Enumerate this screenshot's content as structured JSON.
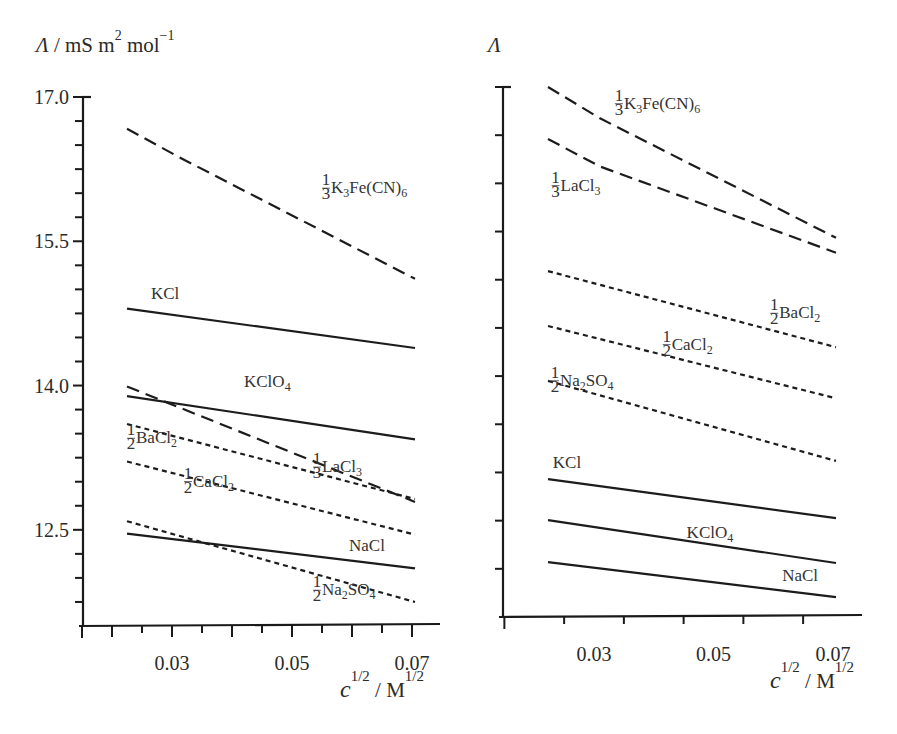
{
  "chart_data": [
    {
      "type": "line",
      "panel": "left",
      "title": "",
      "ylabel": "Λ / mS m² mol⁻¹",
      "ylabel_parts": {
        "symbol": "Λ",
        "unit": "/  mS m",
        "exp1": "2",
        "unit2": " mol",
        "exp2": "−1"
      },
      "xlabel": "c^{1/2} / M^{1/2}",
      "xlabel_parts": {
        "base": "c",
        "exp1": "1/2",
        "sep": " /  M",
        "exp2": "1/2"
      },
      "xlim": [
        0.015,
        0.075
      ],
      "ylim": [
        11.5,
        17.0
      ],
      "x_ticks_labeled": [
        0.03,
        0.05,
        0.07
      ],
      "x_tick_labels": [
        "0.03",
        "0.05",
        "0.07"
      ],
      "x_minor_step": 0.005,
      "y_ticks_labeled": [
        17.0,
        15.5,
        14.0,
        12.5
      ],
      "y_tick_labels": [
        "17.0",
        "15.5",
        "14.0",
        "12.5"
      ],
      "y_minor_step": 0.25,
      "grid": false,
      "series": [
        {
          "name": "⅓K₃Fe(CN)₆",
          "label_main": "K",
          "style": "long-dash",
          "x": [
            0.0225,
            0.031,
            0.0705
          ],
          "y": [
            16.67,
            16.38,
            15.11
          ],
          "label_pos": [
            0.055,
            16.0
          ],
          "frac": "1/3",
          "label_parts": [
            "K",
            "3",
            "Fe(CN)",
            "6"
          ]
        },
        {
          "name": "KCl",
          "style": "solid",
          "x": [
            0.0225,
            0.0705
          ],
          "y": [
            14.8,
            14.39
          ],
          "label_pos": [
            0.0265,
            14.9
          ],
          "label_parts": [
            "KCl"
          ]
        },
        {
          "name": "KClO₄",
          "style": "solid",
          "x": [
            0.0225,
            0.0705
          ],
          "y": [
            13.89,
            13.44
          ],
          "label_pos": [
            0.042,
            13.98
          ],
          "label_parts": [
            "KClO",
            "4"
          ]
        },
        {
          "name": "⅓LaCl₃",
          "style": "long-dash",
          "x": [
            0.0225,
            0.0705
          ],
          "y": [
            13.99,
            12.79
          ],
          "label_pos": [
            0.0535,
            13.1
          ],
          "frac": "1/3",
          "label_parts": [
            "LaCl",
            "3"
          ]
        },
        {
          "name": "½BaCl₂",
          "style": "short-dash",
          "x": [
            0.0225,
            0.0705
          ],
          "y": [
            13.6,
            12.82
          ],
          "label_pos": [
            0.0225,
            13.4
          ],
          "frac": "1/2",
          "label_parts": [
            " BaCl",
            "2"
          ]
        },
        {
          "name": "½CaCl₂",
          "style": "short-dash",
          "x": [
            0.0225,
            0.0705
          ],
          "y": [
            13.21,
            12.45
          ],
          "label_pos": [
            0.032,
            12.95
          ],
          "frac": "1/2",
          "label_parts": [
            "CaCl",
            "2"
          ]
        },
        {
          "name": "NaCl",
          "style": "solid",
          "x": [
            0.0225,
            0.0705
          ],
          "y": [
            12.46,
            12.1
          ],
          "label_pos": [
            0.0595,
            12.28
          ],
          "label_parts": [
            "NaCl"
          ]
        },
        {
          "name": "½Na₂SO₄",
          "style": "short-dash",
          "x": [
            0.0225,
            0.0705
          ],
          "y": [
            12.59,
            11.75
          ],
          "label_pos": [
            0.0535,
            11.82
          ],
          "frac": "1/2",
          "label_parts": [
            " Na",
            "2",
            "SO",
            "4"
          ]
        }
      ]
    },
    {
      "type": "line",
      "panel": "right",
      "title": "",
      "ylabel": "Λ",
      "ylabel_parts": {
        "symbol": "Λ"
      },
      "xlabel": "c^{1/2} / M^{1/2}",
      "xlabel_parts": {
        "base": "c",
        "exp1": "1/2",
        "sep": " /  M",
        "exp2": "1/2"
      },
      "xlim": [
        0.015,
        0.075
      ],
      "ylim": [
        0,
        11
      ],
      "y_units": "unlabeled tick divisions",
      "x_ticks_labeled": [
        0.03,
        0.05,
        0.07
      ],
      "x_tick_labels": [
        "0.03",
        "0.05",
        "0.07"
      ],
      "x_minor_step": 0.01,
      "y_ticks_labeled": [],
      "y_tick_labels": [],
      "y_minor_step": 1,
      "grid": false,
      "series": [
        {
          "name": "⅓K₃Fe(CN)₆",
          "style": "long-dash",
          "x": [
            0.0223,
            0.031,
            0.0705
          ],
          "y": [
            11.0,
            10.35,
            7.87
          ],
          "label_pos": [
            0.0335,
            10.55
          ],
          "frac": "1/3",
          "label_parts": [
            "K",
            "3",
            "Fe(CN)",
            "6"
          ]
        },
        {
          "name": "⅓LaCl₃",
          "style": "long-dash",
          "x": [
            0.0223,
            0.031,
            0.0705
          ],
          "y": [
            9.92,
            9.35,
            7.56
          ],
          "label_pos": [
            0.0229,
            8.85
          ],
          "frac": "1/3",
          "label_parts": [
            "LaCl",
            "3"
          ]
        },
        {
          "name": "½BaCl₂",
          "style": "short-dash",
          "x": [
            0.0223,
            0.0705
          ],
          "y": [
            7.18,
            5.6
          ],
          "label_pos": [
            0.0595,
            6.2
          ],
          "frac": "1/2",
          "label_parts": [
            " BaCl",
            "2"
          ]
        },
        {
          "name": "½CaCl₂",
          "style": "short-dash",
          "x": [
            0.0223,
            0.0705
          ],
          "y": [
            6.04,
            4.54
          ],
          "label_pos": [
            0.0415,
            5.55
          ],
          "frac": "1/2",
          "label_parts": [
            "CaCl",
            "2"
          ]
        },
        {
          "name": "½Na₂SO₄",
          "style": "short-dash",
          "x": [
            0.0223,
            0.0705
          ],
          "y": [
            4.9,
            3.24
          ],
          "label_pos": [
            0.0228,
            4.8
          ],
          "frac": "1/2",
          "label_parts": [
            " Na",
            "2",
            "SO",
            "4"
          ]
        },
        {
          "name": "KCl",
          "style": "solid",
          "x": [
            0.0223,
            0.0705
          ],
          "y": [
            2.86,
            2.05
          ],
          "label_pos": [
            0.0231,
            3.1
          ],
          "label_parts": [
            "KCl"
          ]
        },
        {
          "name": "KClO₄",
          "style": "solid",
          "x": [
            0.0223,
            0.0705
          ],
          "y": [
            2.01,
            1.12
          ],
          "label_pos": [
            0.0455,
            1.65
          ],
          "label_parts": [
            "KClO",
            "4"
          ]
        },
        {
          "name": "NaCl",
          "style": "solid",
          "x": [
            0.0223,
            0.0705
          ],
          "y": [
            1.14,
            0.41
          ],
          "label_pos": [
            0.0615,
            0.75
          ],
          "label_parts": [
            "NaCl"
          ]
        }
      ]
    }
  ]
}
